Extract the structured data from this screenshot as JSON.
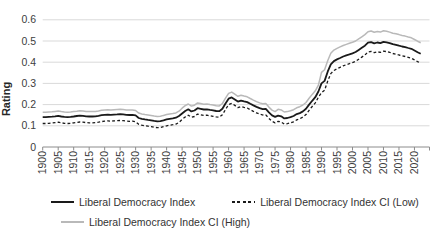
{
  "chart_data": {
    "type": "line",
    "title": "",
    "ylabel": "Rating",
    "xlabel": "",
    "grid": "horizontal",
    "legend_position": "bottom",
    "ylim": [
      0,
      0.6
    ],
    "xlim": [
      1900,
      2022
    ],
    "x_start_year": 1900,
    "x_tick_step_years": 5,
    "y_ticks": [
      0,
      0.1,
      0.2,
      0.3,
      0.4,
      0.5,
      0.6
    ],
    "y_tick_labels": [
      "0",
      "0.1",
      "0.2",
      "0.3",
      "0.4",
      "0.5",
      "0.6"
    ],
    "x_tick_labels": [
      "1900",
      "1905",
      "1910",
      "1915",
      "1920",
      "1925",
      "1930",
      "1935",
      "1940",
      "1945",
      "1950",
      "1955",
      "1960",
      "1965",
      "1970",
      "1975",
      "1980",
      "1985",
      "1990",
      "1995",
      "2000",
      "2005",
      "2010",
      "2015",
      "2020"
    ],
    "series": [
      {
        "name": "Liberal Democracy Index",
        "style": "solid",
        "color": "#1a1a1a",
        "values": [
          0.141,
          0.141,
          0.142,
          0.143,
          0.145,
          0.147,
          0.144,
          0.142,
          0.141,
          0.142,
          0.144,
          0.146,
          0.148,
          0.147,
          0.145,
          0.144,
          0.144,
          0.145,
          0.147,
          0.15,
          0.152,
          0.153,
          0.152,
          0.153,
          0.154,
          0.155,
          0.154,
          0.152,
          0.151,
          0.152,
          0.149,
          0.137,
          0.133,
          0.13,
          0.128,
          0.126,
          0.123,
          0.121,
          0.122,
          0.126,
          0.13,
          0.133,
          0.135,
          0.138,
          0.146,
          0.158,
          0.17,
          0.178,
          0.168,
          0.172,
          0.183,
          0.18,
          0.177,
          0.178,
          0.175,
          0.173,
          0.17,
          0.169,
          0.18,
          0.205,
          0.228,
          0.234,
          0.224,
          0.214,
          0.219,
          0.215,
          0.212,
          0.204,
          0.196,
          0.189,
          0.183,
          0.179,
          0.18,
          0.163,
          0.149,
          0.142,
          0.148,
          0.145,
          0.135,
          0.137,
          0.141,
          0.146,
          0.155,
          0.16,
          0.168,
          0.18,
          0.2,
          0.218,
          0.235,
          0.262,
          0.3,
          0.312,
          0.355,
          0.39,
          0.405,
          0.413,
          0.42,
          0.427,
          0.432,
          0.437,
          0.442,
          0.448,
          0.458,
          0.468,
          0.478,
          0.492,
          0.495,
          0.489,
          0.493,
          0.49,
          0.496,
          0.494,
          0.49,
          0.485,
          0.482,
          0.478,
          0.474,
          0.471,
          0.467,
          0.463,
          0.455,
          0.447,
          0.44
        ]
      },
      {
        "name": "Liberal Democracy Index CI (Low)",
        "style": "dashed",
        "color": "#1a1a1a",
        "values": [
          0.111,
          0.111,
          0.112,
          0.113,
          0.115,
          0.117,
          0.114,
          0.112,
          0.111,
          0.112,
          0.114,
          0.116,
          0.118,
          0.117,
          0.115,
          0.114,
          0.114,
          0.115,
          0.117,
          0.12,
          0.122,
          0.123,
          0.122,
          0.123,
          0.124,
          0.125,
          0.124,
          0.122,
          0.121,
          0.122,
          0.119,
          0.107,
          0.103,
          0.1,
          0.098,
          0.096,
          0.093,
          0.091,
          0.092,
          0.096,
          0.1,
          0.103,
          0.105,
          0.108,
          0.116,
          0.13,
          0.142,
          0.15,
          0.14,
          0.144,
          0.155,
          0.152,
          0.149,
          0.15,
          0.147,
          0.145,
          0.142,
          0.141,
          0.152,
          0.177,
          0.2,
          0.206,
          0.196,
          0.186,
          0.191,
          0.187,
          0.184,
          0.176,
          0.168,
          0.161,
          0.155,
          0.151,
          0.152,
          0.135,
          0.121,
          0.114,
          0.121,
          0.118,
          0.108,
          0.11,
          0.114,
          0.119,
          0.128,
          0.133,
          0.141,
          0.153,
          0.173,
          0.191,
          0.208,
          0.235,
          0.256,
          0.268,
          0.311,
          0.346,
          0.361,
          0.369,
          0.376,
          0.383,
          0.388,
          0.393,
          0.398,
          0.404,
          0.414,
          0.424,
          0.434,
          0.448,
          0.451,
          0.445,
          0.449,
          0.446,
          0.452,
          0.45,
          0.446,
          0.441,
          0.438,
          0.434,
          0.43,
          0.427,
          0.423,
          0.419,
          0.411,
          0.403,
          0.396
        ]
      },
      {
        "name": "Liberal Democracy Index CI (High)",
        "style": "solid",
        "color": "#b9b9b9",
        "values": [
          0.164,
          0.164,
          0.165,
          0.166,
          0.168,
          0.17,
          0.167,
          0.165,
          0.164,
          0.165,
          0.167,
          0.169,
          0.171,
          0.17,
          0.168,
          0.167,
          0.167,
          0.168,
          0.17,
          0.173,
          0.175,
          0.176,
          0.175,
          0.176,
          0.177,
          0.178,
          0.177,
          0.175,
          0.174,
          0.175,
          0.172,
          0.16,
          0.156,
          0.153,
          0.151,
          0.149,
          0.146,
          0.144,
          0.145,
          0.149,
          0.153,
          0.156,
          0.158,
          0.161,
          0.169,
          0.183,
          0.195,
          0.203,
          0.193,
          0.197,
          0.208,
          0.205,
          0.202,
          0.203,
          0.2,
          0.198,
          0.195,
          0.194,
          0.205,
          0.23,
          0.253,
          0.259,
          0.249,
          0.239,
          0.244,
          0.24,
          0.237,
          0.229,
          0.221,
          0.214,
          0.208,
          0.204,
          0.205,
          0.188,
          0.174,
          0.167,
          0.178,
          0.175,
          0.165,
          0.167,
          0.171,
          0.176,
          0.185,
          0.19,
          0.198,
          0.21,
          0.23,
          0.248,
          0.265,
          0.292,
          0.352,
          0.364,
          0.407,
          0.442,
          0.457,
          0.465,
          0.472,
          0.479,
          0.484,
          0.489,
          0.494,
          0.5,
          0.51,
          0.52,
          0.53,
          0.544,
          0.547,
          0.541,
          0.545,
          0.542,
          0.548,
          0.546,
          0.542,
          0.537,
          0.534,
          0.53,
          0.526,
          0.523,
          0.519,
          0.515,
          0.507,
          0.499,
          0.492
        ]
      }
    ],
    "axis_color": "#8c8c8c",
    "gridline_color": "#d9d9d9"
  }
}
